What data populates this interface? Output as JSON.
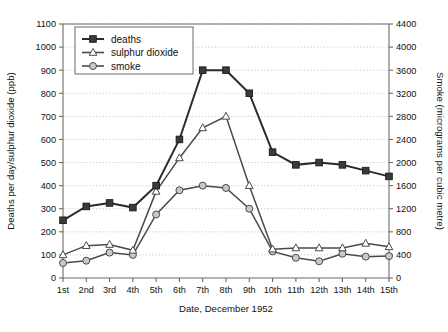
{
  "chart_data": {
    "type": "line",
    "title": "",
    "xlabel": "Date, December 1952",
    "ylabel": "Deaths per day/sulphur dioxide (ppb)",
    "y2label": "Smoke (micrograms per cubic metre)",
    "categories": [
      "1st",
      "2nd",
      "3rd",
      "4th",
      "5th",
      "6th",
      "7th",
      "8th",
      "9th",
      "10th",
      "11th",
      "12th",
      "13th",
      "14th",
      "15th"
    ],
    "ylim": [
      0,
      1100
    ],
    "yticks": [
      0,
      100,
      200,
      300,
      400,
      500,
      600,
      700,
      800,
      900,
      1000,
      1100
    ],
    "y2lim": [
      0,
      4400
    ],
    "y2ticks": [
      0,
      400,
      800,
      1200,
      1600,
      2000,
      2400,
      2800,
      3200,
      3600,
      4000,
      4400
    ],
    "grid": true,
    "legend_position": "top-left",
    "series": [
      {
        "name": "deaths",
        "axis": "left",
        "marker": "filled-square",
        "color": "#2b2b2b",
        "values": [
          250,
          310,
          325,
          305,
          400,
          600,
          900,
          900,
          800,
          545,
          490,
          500,
          490,
          465,
          440
        ]
      },
      {
        "name": "sulphur dioxide",
        "axis": "left",
        "marker": "open-triangle",
        "color": "#4a4a4a",
        "values": [
          100,
          140,
          145,
          120,
          375,
          520,
          650,
          700,
          400,
          125,
          130,
          130,
          130,
          150,
          135
        ]
      },
      {
        "name": "smoke",
        "axis": "right",
        "marker": "open-circle",
        "color": "#4a4a4a",
        "values": [
          260,
          300,
          440,
          400,
          1100,
          1520,
          1600,
          1560,
          1200,
          460,
          350,
          290,
          420,
          370,
          380
        ]
      }
    ]
  },
  "legend": {
    "entries": [
      {
        "label": "deaths"
      },
      {
        "label": "sulphur dioxide"
      },
      {
        "label": "smoke"
      }
    ]
  },
  "top_fragment": "",
  "colors": {
    "axis": "#6b6b6b",
    "grid": "#bdbdbd",
    "deaths": "#2b2b2b",
    "sulphur_dioxide": "#4a4a4a",
    "smoke": "#4a4a4a",
    "background": "#ffffff"
  }
}
